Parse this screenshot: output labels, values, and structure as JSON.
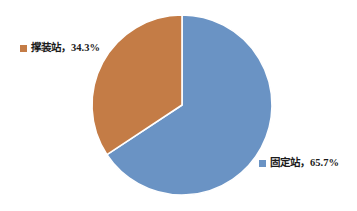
{
  "chart_data": {
    "type": "pie",
    "title": "",
    "subtitle": "",
    "xlabel": "",
    "ylabel": "",
    "grid": false,
    "legend_position": "data-labels-outside",
    "categories": [
      "固定站",
      "撑装站"
    ],
    "values": [
      65.7,
      34.3
    ],
    "unit": "%",
    "start_angle_deg": 0,
    "direction": "clockwise",
    "slices": [
      {
        "name": "固定站",
        "value": 65.7,
        "percent_text": "65.7%",
        "label_text": "固定站，65.7%",
        "color": "#6A93C4",
        "start_deg": 0,
        "end_deg": 236.52
      },
      {
        "name": "撑装站",
        "value": 34.3,
        "percent_text": "34.3%",
        "label_text": "撑装站，34.3%",
        "color": "#C47C46",
        "start_deg": 236.52,
        "end_deg": 360
      }
    ],
    "separator_color": "#FFFFFF"
  },
  "geometry": {
    "center_x": 182,
    "center_y": 105,
    "radius": 90
  },
  "labels": {
    "skid": {
      "text": "撑装站，34.3%",
      "swatch_color": "#C47C46"
    },
    "fixed": {
      "text": "固定站，65.7%",
      "swatch_color": "#6A93C4"
    }
  },
  "canvas": {
    "background": "#FFFFFF",
    "width": 357,
    "height": 211
  }
}
